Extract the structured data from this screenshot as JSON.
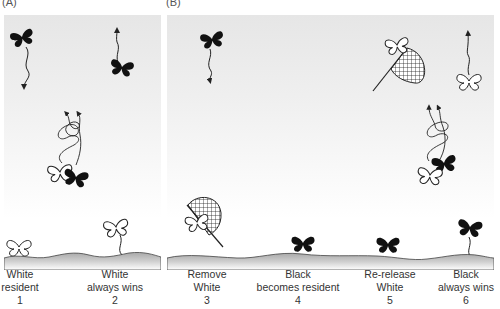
{
  "panels": [
    {
      "id": "A",
      "label": "(A)"
    },
    {
      "id": "B",
      "label": "(B)"
    }
  ],
  "steps": [
    {
      "line1": "White",
      "line2": "resident",
      "number": "1"
    },
    {
      "line1": "White",
      "line2": "always wins",
      "number": "2"
    },
    {
      "line1": "Remove",
      "line2": "White",
      "number": "3"
    },
    {
      "line1": "Black",
      "line2": "becomes resident",
      "number": "4"
    },
    {
      "line1": "Re-release",
      "line2": "White",
      "number": "5"
    },
    {
      "line1": "Black",
      "line2": "always wins",
      "number": "6"
    }
  ],
  "icons": {
    "black_butterfly": "black-butterfly-icon",
    "white_butterfly": "white-butterfly-icon",
    "net": "butterfly-net-icon",
    "spiral_flight": "spiral-flight-path-icon"
  },
  "colors": {
    "sky_top": "#e6e6e6",
    "ground": "#b5b5b5",
    "black_butterfly": "#111111",
    "white_butterfly": "#ffffff",
    "text": "#333333"
  }
}
